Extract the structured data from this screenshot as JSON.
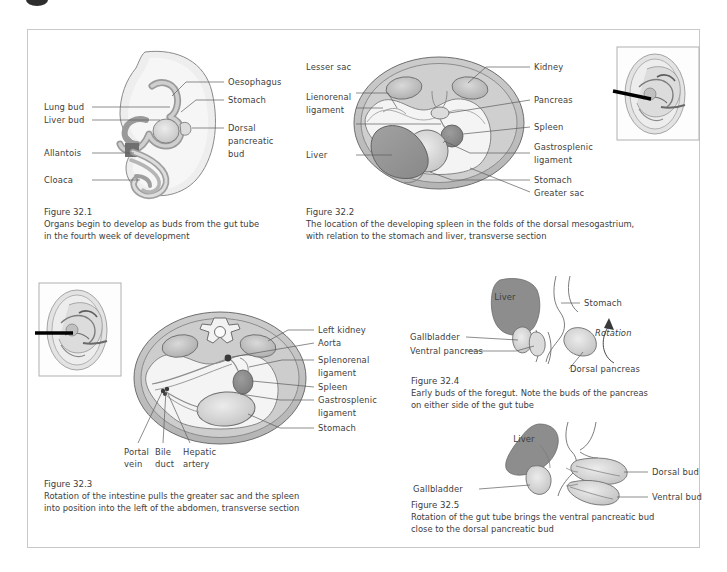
{
  "page": {
    "background": "#ffffff",
    "frame_border_color": "#c9c9c9",
    "ink_color": "#3d3d3d"
  },
  "palette": {
    "body_wall": "#bfbfbf",
    "cavity": "#f2f2f2",
    "liver_dark": "#8e8e8e",
    "liver_mid": "#9a9a9a",
    "organ_light": "#d6d6d6",
    "organ_mid": "#c2c2c2",
    "spleen": "#8c8c8c",
    "arrow_black": "#111111",
    "line": "#6e6e6e"
  },
  "figures": [
    {
      "id": "fig-32-1",
      "number": "Figure 32.1",
      "caption_lines": [
        "Organs begin to develop as buds from the gut tube",
        "in the fourth week of development"
      ],
      "type": "embryo-sagittal",
      "labels_left": [
        {
          "text": "Lung bud"
        },
        {
          "text": "Liver bud"
        },
        {
          "text": "Allantois"
        },
        {
          "text": "Cloaca"
        }
      ],
      "labels_right": [
        {
          "text": "Oesophagus"
        },
        {
          "text": "Stomach"
        },
        {
          "text": "Dorsal"
        },
        {
          "text": "pancreatic"
        },
        {
          "text": "bud"
        }
      ]
    },
    {
      "id": "fig-32-2",
      "number": "Figure 32.2",
      "caption_lines": [
        "The location of the developing spleen in the folds of the dorsal mesogastrium,",
        "with relation to the stomach and liver, transverse section"
      ],
      "type": "transverse-section",
      "labels_left": [
        {
          "text": "Lesser sac"
        },
        {
          "text": "Lienorenal"
        },
        {
          "text": "ligament"
        },
        {
          "text": "Liver"
        }
      ],
      "labels_right": [
        {
          "text": "Kidney"
        },
        {
          "text": "Pancreas"
        },
        {
          "text": "Spleen"
        },
        {
          "text": "Gastrosplenic"
        },
        {
          "text": "ligament"
        },
        {
          "text": "Stomach"
        },
        {
          "text": "Greater sac"
        }
      ],
      "has_thumbnail": true
    },
    {
      "id": "fig-32-3",
      "number": "Figure 32.3",
      "caption_lines": [
        "Rotation of the intestine pulls the greater sac and the spleen",
        "into position into the left of the abdomen, transverse section"
      ],
      "type": "transverse-section",
      "labels_right": [
        {
          "text": "Left kidney"
        },
        {
          "text": "Aorta"
        },
        {
          "text": "Splenorenal"
        },
        {
          "text": "ligament"
        },
        {
          "text": "Spleen"
        },
        {
          "text": "Gastrosplenic"
        },
        {
          "text": "ligament"
        },
        {
          "text": "Stomach"
        }
      ],
      "labels_bottom": [
        {
          "line1": "Portal",
          "line2": "vein"
        },
        {
          "line1": "Bile",
          "line2": "duct"
        },
        {
          "line1": "Hepatic",
          "line2": "artery"
        }
      ],
      "has_thumbnail": true
    },
    {
      "id": "fig-32-4",
      "number": "Figure 32.4",
      "caption_lines": [
        "Early buds of the foregut. Note the buds of the pancreas",
        "on either side of the gut tube"
      ],
      "type": "foregut-buds",
      "labels": [
        {
          "text": "Liver",
          "pos": "inside"
        },
        {
          "text": "Stomach",
          "pos": "right"
        },
        {
          "text": "Rotation",
          "pos": "right"
        },
        {
          "text": "Gallbladder",
          "pos": "left"
        },
        {
          "text": "Ventral pancreas",
          "pos": "left"
        },
        {
          "text": "Dorsal pancreas",
          "pos": "bottom-right"
        }
      ]
    },
    {
      "id": "fig-32-5",
      "number": "Figure 32.5",
      "caption_lines": [
        "Rotation of the gut tube brings the ventral pancreatic bud",
        "close to the dorsal pancreatic bud"
      ],
      "type": "gut-rotation",
      "labels": [
        {
          "text": "Liver",
          "pos": "inside"
        },
        {
          "text": "Gallbladder",
          "pos": "left"
        },
        {
          "text": "Dorsal bud",
          "pos": "right"
        },
        {
          "text": "Ventral bud",
          "pos": "right"
        }
      ]
    }
  ]
}
